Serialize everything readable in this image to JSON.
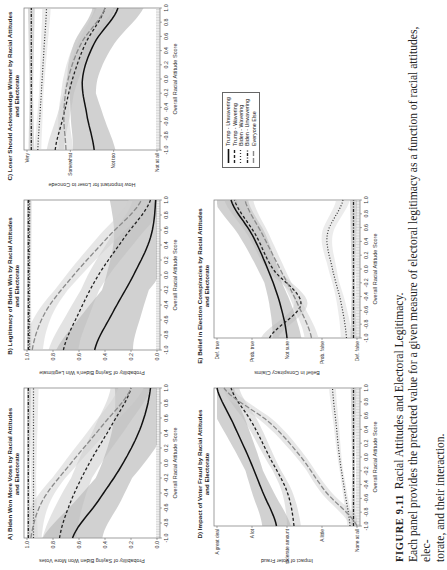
{
  "figure": {
    "label": "FIGURE 9.11",
    "title": "Racial Attitudes and Electoral Legitimacy.",
    "caption_line1": "Each panel provides the predicted value for a given measure of electoral legitimacy as a function of racial attitudes, elec-",
    "caption_line2": "torate, and their interaction."
  },
  "legend": {
    "items": [
      {
        "label": "Trump - Unwavering",
        "style": "solid"
      },
      {
        "label": "Trump - Wavering",
        "style": "short-dash"
      },
      {
        "label": "Biden - Wavering",
        "style": "dotted"
      },
      {
        "label": "Biden - Unwavering",
        "style": "dot-dash"
      },
      {
        "label": "Everyone Else",
        "style": "long-dash"
      }
    ]
  },
  "panels": {
    "A": {
      "title_line1": "A) Biden Won More Votes by Racial Attitudes",
      "title_line2": "and Electorate",
      "ylabel": "Probability of Saying Biden Won More Votes",
      "xlabel": "Overall Racial Attitude Score"
    },
    "B": {
      "title_line1": "B) Legitimacy of Biden Win by Racial Attitudes",
      "title_line2": "and Electorate",
      "ylabel": "Probability of Saying Biden's Win Legitimate",
      "xlabel": "Overall Racial Attitude Score"
    },
    "C": {
      "title_line1": "C) Loser Should Acknowledge Winner by Racial Attitudes",
      "title_line2": "and Electorate",
      "ylabel": "How Important for Loser to Concede",
      "xlabel": "Overall Racial Attitude Score"
    },
    "D": {
      "title_line1": "D) Impact of Voter Fraud by Racial Attitudes",
      "title_line2": "and Electorate",
      "ylabel": "Impact of Voter Fraud",
      "xlabel": "Overall Racial Attitude Score"
    },
    "E": {
      "title_line1": "E) Belief in Election Conspiracies by Racial Attitudes",
      "title_line2": "and Electorate",
      "ylabel": "Belief in Conspiracy Claims",
      "xlabel": "Overall Racial Attitude Score"
    }
  },
  "chart_data": [
    {
      "id": "A",
      "type": "line",
      "title": "A) Biden Won More Votes by Racial Attitudes and Electorate",
      "xlabel": "Overall Racial Attitude Score",
      "ylabel": "Probability of Saying Biden Won More Votes",
      "xlim": [
        -1,
        1
      ],
      "ylim": [
        0,
        1
      ],
      "xticks": [
        "-1.0",
        "-0.8",
        "-0.6",
        "-0.4",
        "-0.2",
        "0.0",
        "0.2",
        "0.4",
        "0.6",
        "0.8",
        "1.0"
      ],
      "yticks": [
        "0.0",
        "0.2",
        "0.4",
        "0.6",
        "0.8",
        "1.0"
      ],
      "yvals": [
        0,
        0.2,
        0.4,
        0.6,
        0.8,
        1.0
      ],
      "x": [
        -1,
        -0.5,
        0,
        0.5,
        1
      ],
      "series": [
        {
          "name": "Trump - Unwavering",
          "values": [
            0.65,
            0.45,
            0.26,
            0.12,
            0.05
          ],
          "band": 0.14
        },
        {
          "name": "Trump - Wavering",
          "values": [
            0.75,
            0.66,
            0.52,
            0.35,
            0.2
          ],
          "band": 0.08
        },
        {
          "name": "Biden - Wavering",
          "values": [
            0.95,
            0.95,
            0.95,
            0.95,
            0.95
          ],
          "band": 0.02
        },
        {
          "name": "Biden - Unwavering",
          "values": [
            0.99,
            0.99,
            0.99,
            0.99,
            0.99
          ],
          "band": 0.01
        },
        {
          "name": "Everyone Else",
          "values": [
            0.97,
            0.88,
            0.66,
            0.42,
            0.2
          ],
          "band": 0.05
        }
      ]
    },
    {
      "id": "B",
      "type": "line",
      "title": "B) Legitimacy of Biden Win by Racial Attitudes and Electorate",
      "xlabel": "Overall Racial Attitude Score",
      "ylabel": "Probability of Saying Biden's Win Legitimate",
      "xlim": [
        -1,
        1
      ],
      "ylim": [
        0,
        1
      ],
      "xticks": [
        "-1.0",
        "-0.8",
        "-0.6",
        "-0.4",
        "-0.2",
        "0.0",
        "0.2",
        "0.4",
        "0.6",
        "0.8",
        "1.0"
      ],
      "yticks": [
        "0.0",
        "0.2",
        "0.4",
        "0.6",
        "0.8",
        "1.0"
      ],
      "yvals": [
        0,
        0.2,
        0.4,
        0.6,
        0.8,
        1.0
      ],
      "x": [
        -1,
        -0.5,
        0,
        0.5,
        1
      ],
      "series": [
        {
          "name": "Trump - Unwavering",
          "values": [
            0.48,
            0.34,
            0.18,
            0.05,
            0.01
          ],
          "band": 0.18
        },
        {
          "name": "Trump - Wavering",
          "values": [
            0.72,
            0.6,
            0.45,
            0.25,
            0.05
          ],
          "band": 0.07
        },
        {
          "name": "Biden - Wavering",
          "values": [
            0.98,
            0.98,
            0.98,
            0.98,
            0.98
          ],
          "band": 0.01
        },
        {
          "name": "Biden - Unwavering",
          "values": [
            0.99,
            0.99,
            0.99,
            0.99,
            0.99
          ],
          "band": 0.01
        },
        {
          "name": "Everyone Else",
          "values": [
            0.96,
            0.86,
            0.64,
            0.38,
            0.12
          ],
          "band": 0.05
        }
      ]
    },
    {
      "id": "C",
      "type": "line",
      "title": "C) Loser Should Acknowledge Winner by Racial Attitudes and Electorate",
      "xlabel": "Overall Racial Attitude Score",
      "ylabel": "How Important for Loser to Concede",
      "xlim": [
        -1,
        1
      ],
      "ylim": [
        1,
        4
      ],
      "xticks": [
        "-1.0",
        "-0.8",
        "-0.6",
        "-0.4",
        "-0.2",
        "0.0",
        "0.2",
        "0.4",
        "0.6",
        "0.8",
        "1.0"
      ],
      "yticks": [
        "Not at all",
        "Not too",
        "Somewhat",
        "Very"
      ],
      "yvals": [
        1,
        2,
        3,
        4
      ],
      "x": [
        -1,
        -0.5,
        0,
        0.5,
        1
      ],
      "series": [
        {
          "name": "Trump - Unwavering",
          "values": [
            2.45,
            2.62,
            2.72,
            2.45,
            1.9
          ],
          "band": 0.3
        },
        {
          "name": "Trump - Wavering",
          "values": [
            3.35,
            3.15,
            2.95,
            2.65,
            2.2
          ],
          "band": 0.12
        },
        {
          "name": "Biden - Wavering",
          "values": [
            3.75,
            3.7,
            3.65,
            3.6,
            3.55
          ],
          "band": 0.05
        },
        {
          "name": "Biden - Unwavering",
          "values": [
            3.9,
            3.9,
            3.9,
            3.9,
            3.9
          ],
          "band": 0.04
        },
        {
          "name": "Everyone Else",
          "values": [
            3.1,
            3.15,
            3.05,
            2.75,
            2.2
          ],
          "band": 0.1
        }
      ]
    },
    {
      "id": "D",
      "type": "line",
      "title": "D) Impact of Voter Fraud by Racial Attitudes and Electorate",
      "xlabel": "Overall Racial Attitude Score",
      "ylabel": "Impact of Voter Fraud",
      "xlim": [
        -1,
        1
      ],
      "ylim": [
        1,
        5
      ],
      "xticks": [
        "-1.0",
        "-0.8",
        "-0.6",
        "-0.4",
        "-0.2",
        "0.0",
        "0.2",
        "0.4",
        "0.6",
        "0.8",
        "1.0"
      ],
      "yticks": [
        "None at all",
        "A little",
        "A moderate amount",
        "A lot",
        "A great deal"
      ],
      "yvals": [
        1,
        2,
        3,
        4,
        5
      ],
      "x": [
        -1,
        -0.5,
        0,
        0.5,
        1
      ],
      "series": [
        {
          "name": "Trump - Unwavering",
          "values": [
            3.3,
            3.7,
            4.1,
            4.55,
            5.0
          ],
          "band": 0.25
        },
        {
          "name": "Trump - Wavering",
          "values": [
            2.8,
            3.0,
            3.5,
            4.0,
            4.6
          ],
          "band": 0.12
        },
        {
          "name": "Biden - Wavering",
          "values": [
            1.2,
            1.35,
            1.5,
            1.6,
            1.7
          ],
          "band": 0.05
        },
        {
          "name": "Biden - Unwavering",
          "values": [
            1.1,
            1.1,
            1.1,
            1.1,
            1.1
          ],
          "band": 0.04
        },
        {
          "name": "Everyone Else",
          "values": [
            1.0,
            1.9,
            2.6,
            3.5,
            4.8
          ],
          "band": 0.12
        }
      ]
    },
    {
      "id": "E",
      "type": "line",
      "title": "E) Belief in Election Conspiracies by Racial Attitudes and Electorate",
      "xlabel": "Overall Racial Attitude Score",
      "ylabel": "Belief in Conspiracy Claims",
      "xlim": [
        -1,
        1
      ],
      "ylim": [
        1,
        5
      ],
      "xticks": [
        "-1.0",
        "-0.8",
        "-0.6",
        "-0.4",
        "-0.2",
        "0.0",
        "0.2",
        "0.4",
        "0.6",
        "0.8",
        "1.0"
      ],
      "yticks": [
        "Def. false",
        "Prob. false",
        "Not sure",
        "Prob. true",
        "Def. true"
      ],
      "yvals": [
        1,
        2,
        3,
        4,
        5
      ],
      "x": [
        -1,
        -0.5,
        0,
        0.5,
        1
      ],
      "series": [
        {
          "name": "Trump - Unwavering",
          "values": [
            3.0,
            3.2,
            3.55,
            4.0,
            4.6
          ],
          "band": 0.25
        },
        {
          "name": "Trump - Wavering",
          "values": [
            3.5,
            2.6,
            3.4,
            3.9,
            4.5
          ],
          "band": 0.15
        },
        {
          "name": "Biden - Wavering",
          "values": [
            1.3,
            1.45,
            1.7,
            1.85,
            1.4
          ],
          "band": 0.1
        },
        {
          "name": "Biden - Unwavering",
          "values": [
            1.1,
            1.1,
            1.1,
            1.1,
            1.1
          ],
          "band": 0.05
        },
        {
          "name": "Everyone Else",
          "values": [
            2.3,
            2.7,
            3.2,
            3.7,
            4.2
          ],
          "band": 0.12
        }
      ]
    }
  ]
}
